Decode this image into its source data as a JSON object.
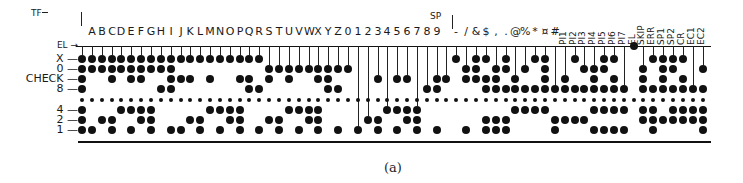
{
  "figure": {
    "caption": "(a)",
    "top_markers": {
      "tf": "TF",
      "sp": "SP"
    },
    "row_labels": [
      {
        "key": "EL",
        "label": "EL →"
      },
      {
        "key": "X",
        "label": "X —"
      },
      {
        "key": "0",
        "label": "0 —"
      },
      {
        "key": "CHECK",
        "label": "CHECK —"
      },
      {
        "key": "8",
        "label": "8 —"
      },
      {
        "key": "FEED",
        "label": ""
      },
      {
        "key": "4",
        "label": "4 —"
      },
      {
        "key": "2",
        "label": "2 —"
      },
      {
        "key": "1",
        "label": "1 —"
      }
    ],
    "columns": [
      {
        "label": "",
        "name": "TF",
        "holes": [
          "X",
          "0",
          "CHECK",
          "8",
          "4",
          "2",
          "1"
        ]
      },
      {
        "label": "A",
        "holes": [
          "X",
          "0",
          "1"
        ]
      },
      {
        "label": "B",
        "holes": [
          "X",
          "0",
          "2"
        ]
      },
      {
        "label": "C",
        "holes": [
          "X",
          "0",
          "CHECK",
          "2",
          "1"
        ]
      },
      {
        "label": "D",
        "holes": [
          "X",
          "0",
          "4"
        ]
      },
      {
        "label": "E",
        "holes": [
          "X",
          "0",
          "CHECK",
          "4",
          "1"
        ]
      },
      {
        "label": "F",
        "holes": [
          "X",
          "0",
          "CHECK",
          "4",
          "2"
        ]
      },
      {
        "label": "G",
        "holes": [
          "X",
          "0",
          "4",
          "2",
          "1"
        ]
      },
      {
        "label": "H",
        "holes": [
          "X",
          "0",
          "8"
        ]
      },
      {
        "label": "I",
        "holes": [
          "X",
          "0",
          "CHECK",
          "8",
          "1"
        ]
      },
      {
        "label": "J",
        "holes": [
          "X",
          "CHECK",
          "1"
        ]
      },
      {
        "label": "K",
        "holes": [
          "X",
          "CHECK",
          "2"
        ]
      },
      {
        "label": "L",
        "holes": [
          "X",
          "2",
          "1"
        ]
      },
      {
        "label": "M",
        "holes": [
          "X",
          "CHECK",
          "4"
        ]
      },
      {
        "label": "N",
        "holes": [
          "X",
          "4",
          "1"
        ]
      },
      {
        "label": "O",
        "holes": [
          "X",
          "4",
          "2"
        ]
      },
      {
        "label": "P",
        "holes": [
          "X",
          "CHECK",
          "4",
          "2",
          "1"
        ]
      },
      {
        "label": "Q",
        "holes": [
          "X",
          "CHECK",
          "8"
        ]
      },
      {
        "label": "R",
        "holes": [
          "X",
          "8",
          "1"
        ]
      },
      {
        "label": "S",
        "holes": [
          "0",
          "CHECK",
          "2"
        ]
      },
      {
        "label": "T",
        "holes": [
          "0",
          "2",
          "1"
        ]
      },
      {
        "label": "U",
        "holes": [
          "0",
          "CHECK",
          "4"
        ]
      },
      {
        "label": "V",
        "holes": [
          "0",
          "4",
          "1"
        ]
      },
      {
        "label": "W",
        "holes": [
          "0",
          "4",
          "2"
        ]
      },
      {
        "label": "X",
        "holes": [
          "0",
          "CHECK",
          "4",
          "2",
          "1"
        ]
      },
      {
        "label": "Y",
        "holes": [
          "0",
          "CHECK",
          "8"
        ]
      },
      {
        "label": "Z",
        "holes": [
          "0",
          "8",
          "1"
        ]
      },
      {
        "label": "0",
        "holes": [
          "0"
        ]
      },
      {
        "label": "1",
        "holes": [
          "1"
        ]
      },
      {
        "label": "2",
        "holes": [
          "2"
        ]
      },
      {
        "label": "3",
        "holes": [
          "CHECK",
          "2",
          "1"
        ]
      },
      {
        "label": "4",
        "holes": [
          "4"
        ]
      },
      {
        "label": "5",
        "holes": [
          "CHECK",
          "4",
          "1"
        ]
      },
      {
        "label": "6",
        "holes": [
          "CHECK",
          "4",
          "2"
        ]
      },
      {
        "label": "7",
        "holes": [
          "4",
          "2",
          "1"
        ]
      },
      {
        "label": "8",
        "holes": [
          "8"
        ]
      },
      {
        "label": "9",
        "holes": [
          "CHECK",
          "8",
          "1"
        ]
      },
      {
        "label": "",
        "name": "SP",
        "holes": [
          "CHECK"
        ]
      },
      {
        "label": "-",
        "holes": [
          "X"
        ]
      },
      {
        "label": "/",
        "holes": [
          "0",
          "CHECK",
          "1"
        ]
      },
      {
        "label": "&",
        "holes": [
          "X",
          "0",
          "CHECK"
        ]
      },
      {
        "label": "$",
        "holes": [
          "X",
          "CHECK",
          "8",
          "2",
          "1"
        ]
      },
      {
        "label": ",",
        "holes": [
          "0",
          "CHECK",
          "8",
          "2",
          "1"
        ]
      },
      {
        "label": ".",
        "holes": [
          "X",
          "0",
          "8",
          "2",
          "1"
        ]
      },
      {
        "label": "@",
        "holes": [
          "CHECK",
          "8",
          "4"
        ]
      },
      {
        "label": "%",
        "holes": [
          "0",
          "8",
          "4"
        ]
      },
      {
        "label": "*",
        "holes": [
          "X",
          "8",
          "4"
        ]
      },
      {
        "label": "¤",
        "holes": [
          "X",
          "0",
          "CHECK",
          "8",
          "4"
        ]
      },
      {
        "label": "#",
        "holes": [
          "8",
          "2",
          "1"
        ]
      },
      {
        "label": "PI1",
        "rot": true,
        "holes": [
          "CHECK",
          "8",
          "2"
        ]
      },
      {
        "label": "PI2",
        "rot": true,
        "holes": [
          "X",
          "8",
          "2"
        ]
      },
      {
        "label": "PI3",
        "rot": true,
        "holes": [
          "0",
          "8",
          "2"
        ]
      },
      {
        "label": "PI4",
        "rot": true,
        "holes": [
          "0",
          "CHECK",
          "8",
          "4",
          "1"
        ]
      },
      {
        "label": "PI5",
        "rot": true,
        "holes": [
          "X",
          "0",
          "8",
          "4",
          "1"
        ]
      },
      {
        "label": "PI6",
        "rot": true,
        "holes": [
          "X",
          "CHECK",
          "8",
          "4",
          "1"
        ]
      },
      {
        "label": "PI7",
        "rot": true,
        "holes": [
          "8",
          "4",
          "1"
        ]
      },
      {
        "label": "EL",
        "rot": true,
        "holes": [
          "EL"
        ]
      },
      {
        "label": "SKIP",
        "rot": true,
        "holes": [
          "0",
          "CHECK",
          "8",
          "4",
          "2"
        ]
      },
      {
        "label": "ERR",
        "rot": true,
        "holes": [
          "X",
          "8",
          "4",
          "2",
          "1"
        ]
      },
      {
        "label": "SP1",
        "rot": true,
        "holes": [
          "X",
          "0",
          "CHECK",
          "8",
          "2"
        ]
      },
      {
        "label": "SP2",
        "rot": true,
        "holes": [
          "X",
          "0",
          "8",
          "4",
          "2"
        ]
      },
      {
        "label": "CR",
        "rot": true,
        "holes": [
          "X",
          "CHECK",
          "8",
          "4",
          "2"
        ]
      },
      {
        "label": "EC1",
        "rot": true,
        "holes": [
          "8",
          "4",
          "2"
        ]
      },
      {
        "label": "EC2",
        "rot": true,
        "holes": [
          "0",
          "8",
          "4",
          "2",
          "1"
        ]
      }
    ]
  }
}
